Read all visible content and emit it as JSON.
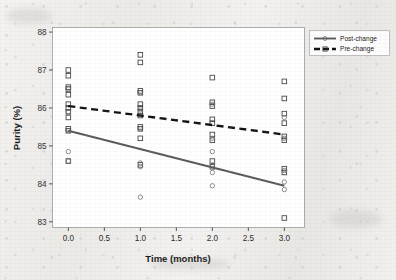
{
  "chart_data": {
    "type": "scatter",
    "title": "",
    "xlabel": "Time (months)",
    "ylabel": "Purity (%)",
    "xlim": [
      -0.22,
      3.28
    ],
    "ylim": [
      82.85,
      88.12
    ],
    "xticks": [
      "0.0",
      "0.5",
      "1.0",
      "1.5",
      "2.0",
      "2.5",
      "3.0"
    ],
    "xtick_values": [
      0.0,
      0.5,
      1.0,
      1.5,
      2.0,
      2.5,
      3.0
    ],
    "yticks": [
      "83",
      "84",
      "85",
      "86",
      "87",
      "88"
    ],
    "ytick_values": [
      83,
      84,
      85,
      86,
      87,
      88
    ],
    "grid": false,
    "legend_position": "top-right",
    "legend": [
      {
        "label": "Post-change",
        "style": "solid",
        "color": "#585858",
        "marker": "circle"
      },
      {
        "label": "Pre-change",
        "style": "dashed",
        "color": "#101010",
        "marker": "square"
      }
    ],
    "series": [
      {
        "name": "Pre-change",
        "marker": "square",
        "line_style": "dashed",
        "color": "#101010",
        "fit_line": {
          "x": [
            0.0,
            3.0
          ],
          "y": [
            86.05,
            85.3
          ]
        },
        "points": [
          {
            "x": 0.0,
            "y": 87.0
          },
          {
            "x": 0.0,
            "y": 86.85
          },
          {
            "x": 0.0,
            "y": 86.55
          },
          {
            "x": 0.0,
            "y": 86.5
          },
          {
            "x": 0.0,
            "y": 86.35
          },
          {
            "x": 0.0,
            "y": 86.1
          },
          {
            "x": 0.0,
            "y": 86.0
          },
          {
            "x": 0.0,
            "y": 85.9
          },
          {
            "x": 0.0,
            "y": 85.75
          },
          {
            "x": 0.0,
            "y": 85.45
          },
          {
            "x": 0.0,
            "y": 85.4
          },
          {
            "x": 0.0,
            "y": 84.6
          },
          {
            "x": 1.0,
            "y": 87.4
          },
          {
            "x": 1.0,
            "y": 87.2
          },
          {
            "x": 1.0,
            "y": 86.45
          },
          {
            "x": 1.0,
            "y": 86.4
          },
          {
            "x": 1.0,
            "y": 86.1
          },
          {
            "x": 1.0,
            "y": 86.0
          },
          {
            "x": 1.0,
            "y": 85.9
          },
          {
            "x": 1.0,
            "y": 85.8
          },
          {
            "x": 1.0,
            "y": 85.5
          },
          {
            "x": 1.0,
            "y": 85.45
          },
          {
            "x": 1.0,
            "y": 85.2
          },
          {
            "x": 1.0,
            "y": 84.5
          },
          {
            "x": 2.0,
            "y": 86.8
          },
          {
            "x": 2.0,
            "y": 86.15
          },
          {
            "x": 2.0,
            "y": 86.05
          },
          {
            "x": 2.0,
            "y": 85.7
          },
          {
            "x": 2.0,
            "y": 85.6
          },
          {
            "x": 2.0,
            "y": 85.3
          },
          {
            "x": 2.0,
            "y": 85.15
          },
          {
            "x": 2.0,
            "y": 84.6
          },
          {
            "x": 2.0,
            "y": 84.45
          },
          {
            "x": 3.0,
            "y": 86.7
          },
          {
            "x": 3.0,
            "y": 86.25
          },
          {
            "x": 3.0,
            "y": 85.85
          },
          {
            "x": 3.0,
            "y": 85.6
          },
          {
            "x": 3.0,
            "y": 85.25
          },
          {
            "x": 3.0,
            "y": 85.15
          },
          {
            "x": 3.0,
            "y": 84.4
          },
          {
            "x": 3.0,
            "y": 84.3
          },
          {
            "x": 3.0,
            "y": 83.1
          }
        ]
      },
      {
        "name": "Post-change",
        "marker": "circle",
        "line_style": "solid",
        "color": "#585858",
        "fit_line": {
          "x": [
            0.0,
            3.0
          ],
          "y": [
            85.4,
            83.95
          ]
        },
        "points": [
          {
            "x": 0.0,
            "y": 86.5
          },
          {
            "x": 0.0,
            "y": 85.9
          },
          {
            "x": 0.0,
            "y": 85.4
          },
          {
            "x": 0.0,
            "y": 84.85
          },
          {
            "x": 0.0,
            "y": 84.6
          },
          {
            "x": 1.0,
            "y": 86.4
          },
          {
            "x": 1.0,
            "y": 85.95
          },
          {
            "x": 1.0,
            "y": 85.45
          },
          {
            "x": 1.0,
            "y": 84.55
          },
          {
            "x": 1.0,
            "y": 84.45
          },
          {
            "x": 1.0,
            "y": 83.65
          },
          {
            "x": 2.0,
            "y": 86.1
          },
          {
            "x": 2.0,
            "y": 85.2
          },
          {
            "x": 2.0,
            "y": 84.85
          },
          {
            "x": 2.0,
            "y": 84.5
          },
          {
            "x": 2.0,
            "y": 84.3
          },
          {
            "x": 2.0,
            "y": 83.95
          },
          {
            "x": 3.0,
            "y": 85.75
          },
          {
            "x": 3.0,
            "y": 85.2
          },
          {
            "x": 3.0,
            "y": 84.35
          },
          {
            "x": 3.0,
            "y": 84.05
          },
          {
            "x": 3.0,
            "y": 83.85
          }
        ]
      }
    ]
  }
}
